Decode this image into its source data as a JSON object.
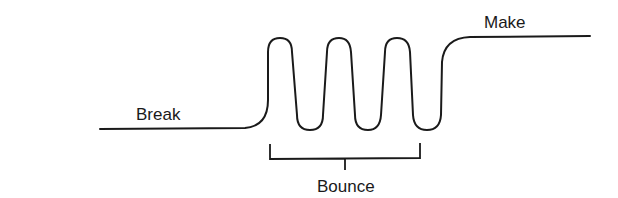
{
  "diagram": {
    "type": "switch-contact-bounce-waveform",
    "labels": {
      "break": "Break",
      "make": "Make",
      "bounce": "Bounce"
    },
    "colors": {
      "stroke": "#1a1a1a",
      "background": "#ffffff"
    },
    "bounce_loops": 3
  }
}
